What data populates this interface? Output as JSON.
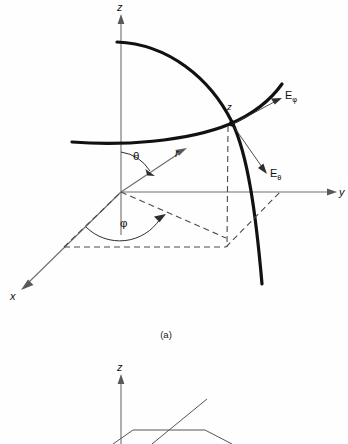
{
  "figure": {
    "domain": "diagram",
    "title_visible": false,
    "background_color": "#fefefe",
    "ink_color": "#111111",
    "axis_color": "#6e6e6e",
    "dashed_color": "#4a4a4a",
    "panels": [
      {
        "id": "panel-a",
        "caption": "(a)",
        "description": "spherical coordinate system with field components"
      },
      {
        "id": "panel-b",
        "caption": "",
        "description": "partially visible second figure, cropped at bottom edge"
      }
    ],
    "panel_a": {
      "axes": [
        {
          "name": "z-axis",
          "label": "z",
          "direction": "up"
        },
        {
          "name": "y-axis",
          "label": "y",
          "direction": "right"
        },
        {
          "name": "x-axis",
          "label": "x",
          "direction": "down-left"
        }
      ],
      "angles": [
        {
          "name": "theta",
          "label": "θ",
          "from": "z-axis",
          "to": "radial-vector"
        },
        {
          "name": "phi",
          "label": "φ",
          "from": "x-axis",
          "to": "xy-projection"
        }
      ],
      "radial": {
        "name": "radius",
        "label": "r"
      },
      "point": {
        "name": "field-point",
        "label": "z"
      },
      "field_components": [
        {
          "name": "E-phi",
          "base": "E",
          "subscript": "φ",
          "direction": "up-right",
          "tangent_to": "constant-theta circle"
        },
        {
          "name": "E-theta",
          "base": "E",
          "subscript": "θ",
          "direction": "down-right",
          "tangent_to": "meridian arc"
        }
      ],
      "curves": [
        {
          "name": "meridian-arc",
          "style": "bold"
        },
        {
          "name": "constant-theta-arc",
          "style": "bold"
        }
      ],
      "dashed_elements": [
        "vertical-drop-line",
        "xy-projection-parallelogram",
        "radial-projection-line"
      ]
    },
    "panel_b": {
      "axes": [
        {
          "name": "z-axis",
          "label": "z",
          "direction": "up"
        }
      ],
      "elements": [
        "plane-outline",
        "diagonal-segment"
      ]
    }
  }
}
